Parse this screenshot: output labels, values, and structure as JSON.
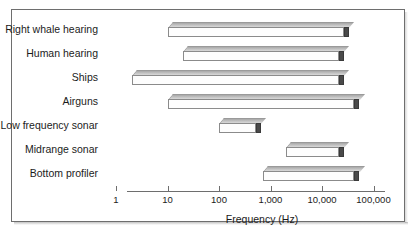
{
  "figure": {
    "axis_title": "Frequency (Hz)",
    "frame_color": "#6e6e6e"
  },
  "chart_data": {
    "type": "bar",
    "orientation": "horizontal",
    "subtype": "range-bar",
    "title": "",
    "xlabel": "Frequency (Hz)",
    "ylabel": "",
    "xscale": "log",
    "xlim": [
      1,
      100000
    ],
    "xticks": [
      1,
      10,
      100,
      1000,
      10000,
      100000
    ],
    "xticklabels": [
      "1",
      "10",
      "100",
      "1,000",
      "10,000",
      "100,000"
    ],
    "grid": false,
    "legend": false,
    "categories": [
      "Right whale hearing",
      "Human hearing",
      "Ships",
      "Airguns",
      "Low frequency sonar",
      "Midrange sonar",
      "Bottom profiler"
    ],
    "ranges": [
      {
        "label": "Right whale hearing",
        "start": 10,
        "end": 25000
      },
      {
        "label": "Human hearing",
        "start": 20,
        "end": 20000
      },
      {
        "label": "Ships",
        "start": 2,
        "end": 20000
      },
      {
        "label": "Airguns",
        "start": 10,
        "end": 40000
      },
      {
        "label": "Low frequency sonar",
        "start": 100,
        "end": 500
      },
      {
        "label": "Midrange sonar",
        "start": 2000,
        "end": 20000
      },
      {
        "label": "Bottom profiler",
        "start": 700,
        "end": 40000
      }
    ]
  }
}
